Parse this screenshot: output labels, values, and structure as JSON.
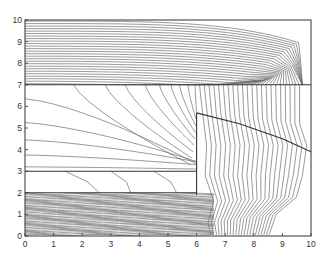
{
  "chart_data": {
    "type": "contour",
    "title": "",
    "xlabel": "",
    "ylabel": "",
    "xlim": [
      0,
      10
    ],
    "ylim": [
      0,
      10
    ],
    "xticks": [
      "0",
      "1",
      "2",
      "3",
      "4",
      "5",
      "6",
      "7",
      "8",
      "9",
      "10"
    ],
    "yticks": [
      "0",
      "1",
      "2",
      "3",
      "4",
      "5",
      "6",
      "7",
      "8",
      "9",
      "10"
    ],
    "grid": false,
    "legend": null,
    "line_color": "#6e6e6e",
    "boundary_color": "#333333",
    "region_boundaries": [
      {
        "name": "top-layer-boundary",
        "points": [
          [
            0,
            7
          ],
          [
            10,
            7
          ]
        ]
      },
      {
        "name": "middle-shelf-upper",
        "points": [
          [
            0,
            3
          ],
          [
            6,
            3
          ]
        ]
      },
      {
        "name": "middle-shelf-lower",
        "points": [
          [
            0,
            2
          ],
          [
            6,
            2
          ]
        ]
      },
      {
        "name": "inclusion-left-edge",
        "points": [
          [
            6,
            1.9
          ],
          [
            6,
            5.7
          ]
        ]
      },
      {
        "name": "inclusion-diagonal",
        "points": [
          [
            6,
            5.7
          ],
          [
            7.5,
            5.2
          ],
          [
            9,
            4.5
          ],
          [
            10,
            3.9
          ]
        ]
      }
    ]
  }
}
